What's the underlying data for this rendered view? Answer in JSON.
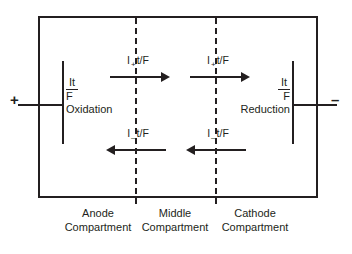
{
  "figure": {
    "type": "electrolysis-cell-diagram",
    "line_color": "#231f20",
    "background": "#ffffff"
  },
  "terminals": {
    "positive": "+",
    "negative": "–"
  },
  "electrodes": {
    "anode": {
      "numerator": "It",
      "denominator": "F",
      "reaction": "Oxidation"
    },
    "cathode": {
      "numerator": "It",
      "denominator": "F",
      "reaction": "Reduction"
    }
  },
  "fluxes": [
    {
      "id": "cation-anode-to-middle",
      "symbol": "I",
      "subscript": "+",
      "expression": "t/F",
      "direction": "right"
    },
    {
      "id": "cation-middle-to-cathode",
      "symbol": "I",
      "subscript": "+",
      "expression": "t/F",
      "direction": "right"
    },
    {
      "id": "anion-middle-to-anode",
      "symbol": "I",
      "subscript": "–",
      "expression": "t/F",
      "direction": "left"
    },
    {
      "id": "anion-cathode-to-middle",
      "symbol": "I",
      "subscript": "–",
      "expression": "t/F",
      "direction": "left"
    }
  ],
  "compartments": [
    {
      "id": "anode",
      "line1": "Anode",
      "line2": "Compartment"
    },
    {
      "id": "middle",
      "line1": "Middle",
      "line2": "Compartment"
    },
    {
      "id": "cathode",
      "line1": "Cathode",
      "line2": "Compartment"
    }
  ]
}
